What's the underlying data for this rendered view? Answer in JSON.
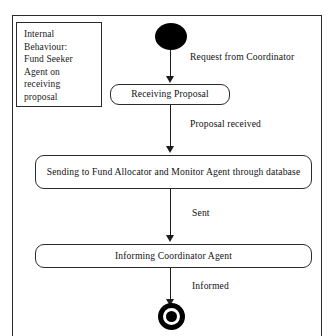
{
  "diagram": {
    "type": "uml-activity-diagram",
    "note": {
      "text": "Internal\nBehaviour:\nFund Seeker\nAgent on\nreceiving\nproposal"
    },
    "nodes": {
      "start": {
        "name": "initial-node",
        "shape": "filled-circle"
      },
      "end": {
        "name": "final-node",
        "shape": "bullseye-circle"
      }
    },
    "activities": [
      {
        "id": "receiving",
        "label": "Receiving Proposal"
      },
      {
        "id": "sending",
        "label": "Sending to Fund Allocator and Monitor Agent through database"
      },
      {
        "id": "informing",
        "label": "Informing Coordinator Agent"
      }
    ],
    "transitions": [
      {
        "id": "t1",
        "label": "Request from Coordinator",
        "from": "initial-node",
        "to": "receiving"
      },
      {
        "id": "t2",
        "label": "Proposal received",
        "from": "receiving",
        "to": "sending"
      },
      {
        "id": "t3",
        "label": "Sent",
        "from": "sending",
        "to": "informing"
      },
      {
        "id": "t4",
        "label": "Informed",
        "from": "informing",
        "to": "final-node"
      }
    ],
    "colors": {
      "stroke": "#2b2b2b",
      "fill": "#ffffff",
      "node_fill": "#000000",
      "text": "#111111"
    }
  }
}
